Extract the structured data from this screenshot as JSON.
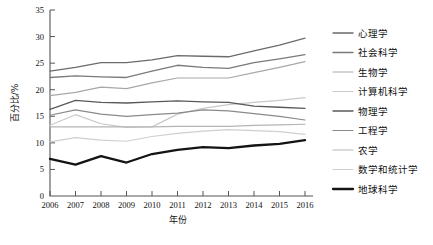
{
  "chart_data": {
    "type": "line",
    "title": "",
    "xlabel": "年份",
    "ylabel": "百分比/%",
    "grid": false,
    "legend_position": "right",
    "x": [
      2006,
      2007,
      2008,
      2009,
      2010,
      2011,
      2012,
      2013,
      2014,
      2015,
      2016
    ],
    "xtick_labels": [
      "2006",
      "2007",
      "2008",
      "2009",
      "2010",
      "2011",
      "2012",
      "2013",
      "2014",
      "2015",
      "2016"
    ],
    "ytick_labels": [
      "0",
      "5",
      "10",
      "15",
      "20",
      "25",
      "30",
      "35"
    ],
    "ytick_values": [
      0,
      5,
      10,
      15,
      20,
      25,
      30,
      35
    ],
    "ylim": [
      0,
      35
    ],
    "xlim": [
      2006,
      2016
    ],
    "series": [
      {
        "name": "心理学",
        "color": "#6b6b6b",
        "width": 1.3,
        "values": [
          23.5,
          24.2,
          25.1,
          25.1,
          25.6,
          26.4,
          26.3,
          26.2,
          27.3,
          28.4,
          29.7
        ]
      },
      {
        "name": "社会科学",
        "color": "#7a7a7a",
        "width": 1.3,
        "values": [
          22.3,
          22.6,
          22.4,
          22.3,
          23.5,
          24.6,
          24.2,
          24.0,
          25.1,
          25.8,
          26.6
        ]
      },
      {
        "name": "生物学",
        "color": "#a8a8a8",
        "width": 1.2,
        "values": [
          18.9,
          19.5,
          20.5,
          20.2,
          21.3,
          22.2,
          22.2,
          22.2,
          23.2,
          24.2,
          25.3
        ]
      },
      {
        "name": "计算机科学",
        "color": "#c9c9c9",
        "width": 1.2,
        "values": [
          13.3,
          15.3,
          13.6,
          12.9,
          13.0,
          15.4,
          16.5,
          17.2,
          17.6,
          18.0,
          18.5
        ]
      },
      {
        "name": "物理学",
        "color": "#595959",
        "width": 1.3,
        "values": [
          16.3,
          18.0,
          17.6,
          17.5,
          17.7,
          17.9,
          17.7,
          17.6,
          16.9,
          16.7,
          16.5
        ]
      },
      {
        "name": "工程学",
        "color": "#8a8a8a",
        "width": 1.2,
        "values": [
          15.2,
          16.2,
          15.4,
          15.0,
          15.3,
          15.6,
          16.2,
          16.0,
          15.5,
          15.0,
          14.3
        ]
      },
      {
        "name": "农学",
        "color": "#b5b5b5",
        "width": 1.2,
        "values": [
          13.0,
          13.0,
          13.0,
          13.0,
          13.0,
          13.1,
          13.1,
          13.1,
          13.3,
          13.4,
          13.5
        ]
      },
      {
        "name": "数学和统计学",
        "color": "#cfcfcf",
        "width": 1.2,
        "values": [
          10.2,
          11.0,
          10.5,
          10.3,
          11.2,
          11.8,
          12.2,
          12.5,
          12.3,
          12.1,
          11.6
        ]
      },
      {
        "name": "地球科学",
        "color": "#141414",
        "width": 2.3,
        "values": [
          7.0,
          5.9,
          7.5,
          6.3,
          7.9,
          8.7,
          9.2,
          9.0,
          9.5,
          9.8,
          10.5
        ]
      }
    ]
  }
}
